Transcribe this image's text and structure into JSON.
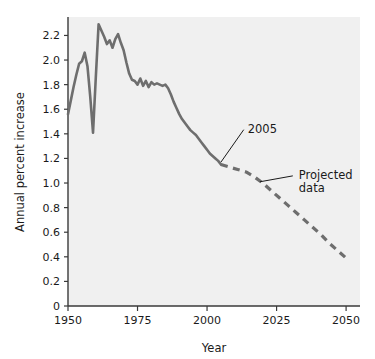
{
  "chart_data": {
    "type": "line",
    "title": "",
    "xlabel": "Year",
    "ylabel": "Annual percent increase",
    "xlim": [
      1950,
      2055
    ],
    "ylim": [
      0,
      2.35
    ],
    "xticks": [
      1950,
      1975,
      2000,
      2025,
      2050
    ],
    "xtick_labels": [
      "1950",
      "1975",
      "2000",
      "2025",
      "2050"
    ],
    "yticks": [
      0,
      0.2,
      0.4,
      0.6,
      0.8,
      1.0,
      1.2,
      1.4,
      1.6,
      1.8,
      2.0,
      2.2
    ],
    "ytick_labels": [
      "0",
      "0.2",
      "0.4",
      "0.6",
      "0.8",
      "1.0",
      "1.2",
      "1.4",
      "1.6",
      "1.8",
      "2.0",
      "2.2"
    ],
    "grid": false,
    "legend_position": "none",
    "line_color": "#6e6e6e",
    "background_color": "#fefefe",
    "series": [
      {
        "name": "Historical data",
        "style": "solid",
        "color": "#6e6e6e",
        "x": [
          1950,
          1951,
          1952,
          1953,
          1954,
          1955,
          1956,
          1957,
          1958,
          1959,
          1960,
          1961,
          1962,
          1963,
          1964,
          1965,
          1966,
          1967,
          1968,
          1969,
          1970,
          1971,
          1972,
          1973,
          1974,
          1975,
          1976,
          1977,
          1978,
          1979,
          1980,
          1981,
          1982,
          1983,
          1984,
          1985,
          1986,
          1987,
          1988,
          1989,
          1990,
          1991,
          1992,
          1993,
          1994,
          1995,
          1996,
          1997,
          1998,
          1999,
          2000,
          2001,
          2002,
          2003,
          2004,
          2005
        ],
        "y": [
          1.56,
          1.67,
          1.78,
          1.88,
          1.97,
          1.99,
          2.06,
          1.95,
          1.7,
          1.41,
          1.86,
          2.29,
          2.24,
          2.19,
          2.13,
          2.16,
          2.1,
          2.17,
          2.21,
          2.14,
          2.08,
          1.98,
          1.89,
          1.84,
          1.83,
          1.8,
          1.85,
          1.79,
          1.83,
          1.78,
          1.82,
          1.8,
          1.81,
          1.8,
          1.79,
          1.8,
          1.77,
          1.72,
          1.66,
          1.61,
          1.56,
          1.52,
          1.49,
          1.46,
          1.43,
          1.41,
          1.39,
          1.36,
          1.33,
          1.3,
          1.27,
          1.24,
          1.22,
          1.2,
          1.18,
          1.15
        ]
      },
      {
        "name": "Projected data",
        "style": "dashed",
        "color": "#6e6e6e",
        "x": [
          2005,
          2008,
          2011,
          2014,
          2017,
          2020,
          2023,
          2026,
          2029,
          2032,
          2035,
          2038,
          2041,
          2044,
          2047,
          2050
        ],
        "y": [
          1.15,
          1.13,
          1.11,
          1.09,
          1.05,
          1.0,
          0.94,
          0.88,
          0.82,
          0.76,
          0.7,
          0.64,
          0.58,
          0.51,
          0.45,
          0.39
        ]
      }
    ],
    "annotations": [
      {
        "name": "year-2005-annotation",
        "label": "2005",
        "text_x": 2006,
        "text_y": 1.45,
        "point_x": 2005,
        "point_y": 1.17
      },
      {
        "name": "projected-data-annotation",
        "label_line1": "Projected",
        "label_line2": "data",
        "text_x": 2033,
        "text_y": 1.05,
        "point_x": 2019,
        "point_y": 1.01
      }
    ]
  }
}
